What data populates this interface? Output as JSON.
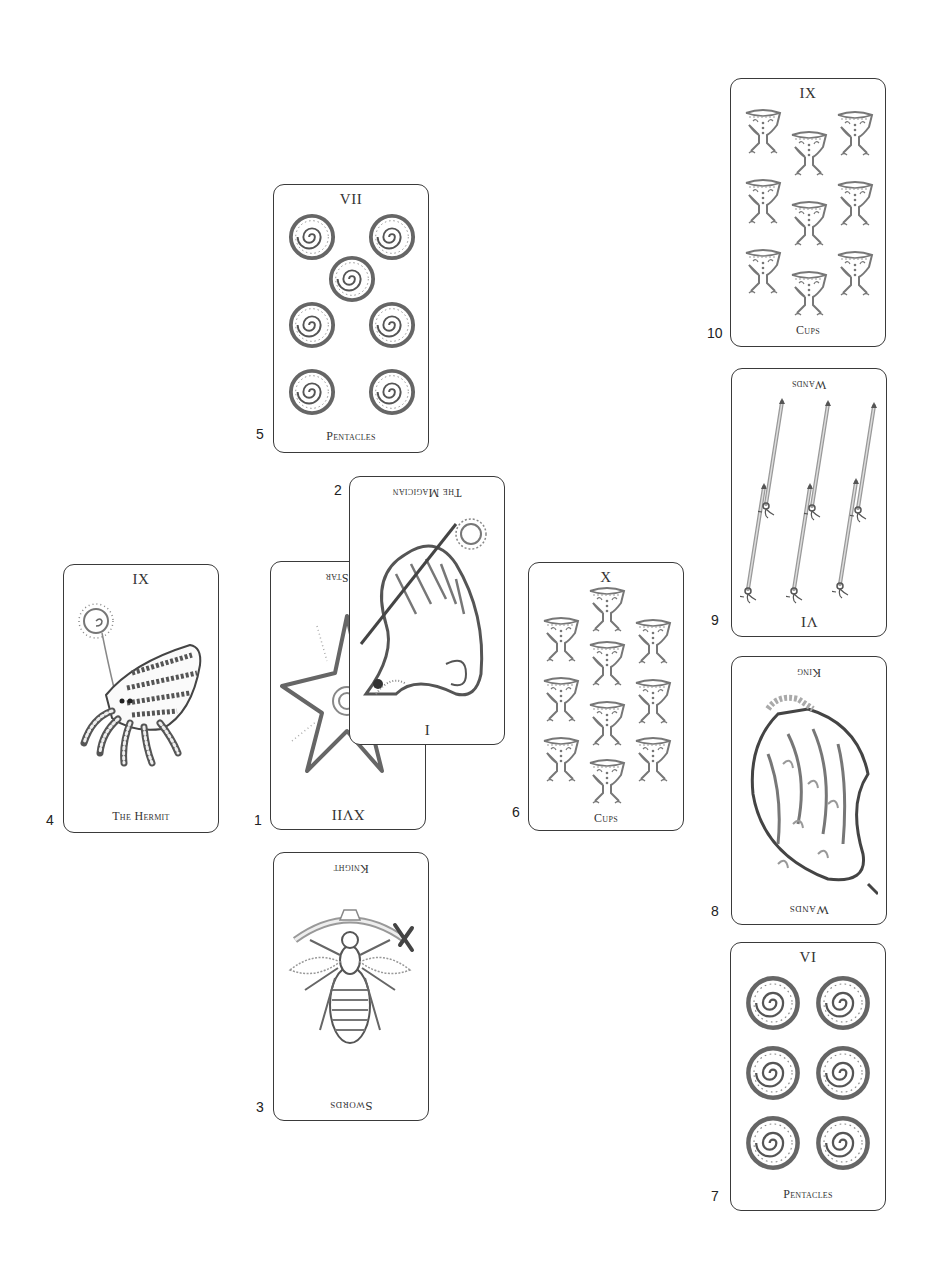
{
  "spread": {
    "cards": [
      {
        "position": "1",
        "numeral": "XVII",
        "title": "The Star",
        "title_visible": "Star",
        "reversed": true,
        "art": "starfish"
      },
      {
        "position": "2",
        "numeral": "I",
        "title": "The Magician",
        "reversed": true,
        "art": "chameleon"
      },
      {
        "position": "3",
        "numeral": "",
        "title": "Knight",
        "suit": "Swords",
        "reversed": true,
        "art": "insect-with-sword"
      },
      {
        "position": "4",
        "numeral": "IX",
        "title": "The Hermit",
        "reversed": false,
        "art": "hermit-crab"
      },
      {
        "position": "5",
        "numeral": "VII",
        "title": "Pentacles",
        "reversed": false,
        "art": "pentacles",
        "count": 7
      },
      {
        "position": "6",
        "numeral": "X",
        "title": "Cups",
        "reversed": false,
        "art": "cups",
        "count": 10
      },
      {
        "position": "7",
        "numeral": "VI",
        "title": "Pentacles",
        "reversed": false,
        "art": "pentacles",
        "count": 6
      },
      {
        "position": "8",
        "numeral": "",
        "title": "King",
        "suit": "Wands",
        "reversed": true,
        "art": "fire-bird"
      },
      {
        "position": "9",
        "numeral": "VI",
        "title": "Wands",
        "reversed": true,
        "art": "wands",
        "count": 6
      },
      {
        "position": "10",
        "numeral": "IX",
        "title": "Cups",
        "reversed": false,
        "art": "cups",
        "count": 9
      }
    ]
  },
  "colors": {
    "card_border": "#3a3a3a",
    "ink": "#555555",
    "background": "#ffffff"
  }
}
